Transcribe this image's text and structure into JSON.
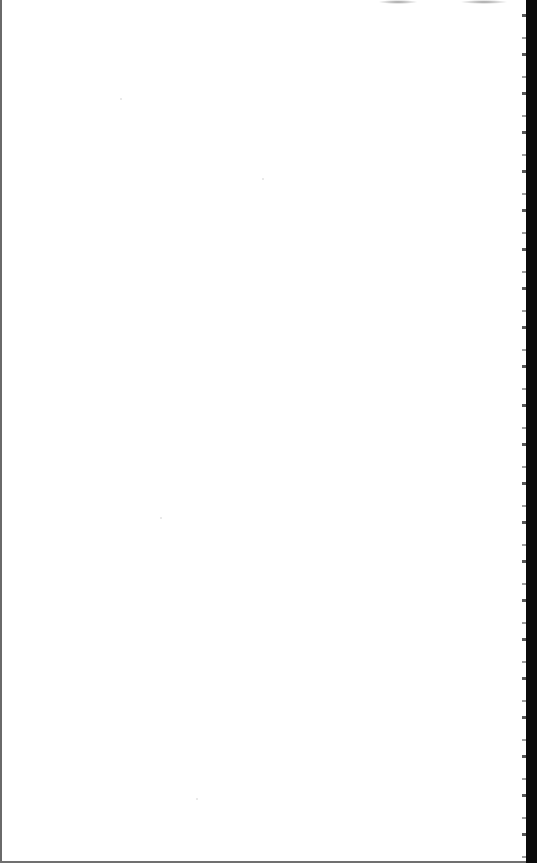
{
  "document": {
    "type": "scanned-page",
    "content": "",
    "colors": {
      "paper": "#ffffff",
      "left_border": "#6a6a6a",
      "right_edge": "#0a0a0a",
      "bottom_border": "#707070"
    }
  }
}
